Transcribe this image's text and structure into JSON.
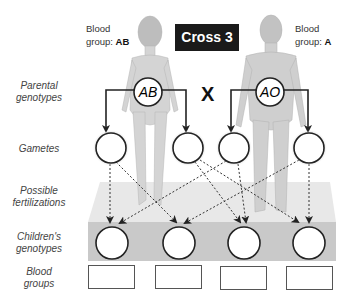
{
  "title": "Cross 3",
  "cross_symbol": "X",
  "mother": {
    "blood_label_line1": "Blood",
    "blood_label_prefix": "group: ",
    "blood_group": "AB",
    "genotype": "AB"
  },
  "father": {
    "blood_label_line1": "Blood",
    "blood_label_prefix": "group: ",
    "blood_group": "A",
    "genotype": "AO"
  },
  "row_labels": {
    "parental_1": "Parental",
    "parental_2": "genotypes",
    "gametes": "Gametes",
    "fert_1": "Possible",
    "fert_2": "fertilizations",
    "children_1": "Children's",
    "children_2": "genotypes",
    "blood_1": "Blood",
    "blood_2": "groups"
  },
  "gametes": [
    "",
    "",
    "",
    ""
  ],
  "children_genotypes": [
    "",
    "",
    "",
    ""
  ],
  "blood_groups": [
    "",
    "",
    "",
    ""
  ],
  "colors": {
    "title_bg": "#1a1a1a",
    "platform_top": "#e6e6e6",
    "platform_band": "#c8c8c8",
    "circle_stroke": "#222222"
  }
}
